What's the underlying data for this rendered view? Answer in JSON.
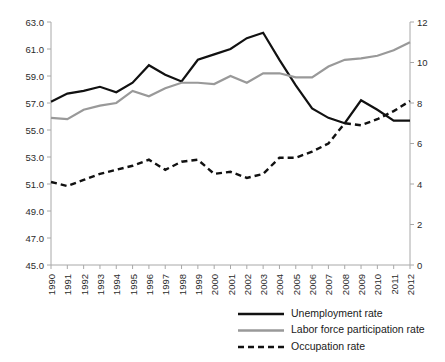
{
  "chart_data": {
    "type": "line",
    "title": "",
    "subtitle": "",
    "xlabel": "",
    "ylabel": "",
    "grid": false,
    "legend_position": "bottom-right",
    "categories": [
      "1990",
      "1991",
      "1992",
      "1993",
      "1994",
      "1995",
      "1996",
      "1997",
      "1998",
      "1999",
      "2000",
      "2001",
      "2002",
      "2003",
      "2004",
      "2005",
      "2006",
      "2007",
      "2008",
      "2009",
      "2010",
      "2011",
      "2012"
    ],
    "axes": {
      "left": {
        "label": "",
        "min": 45.0,
        "max": 63.0,
        "step": 2.0,
        "ticks": [
          "45.0",
          "47.0",
          "49.0",
          "51.0",
          "53.0",
          "55.0",
          "57.0",
          "59.0",
          "61.0",
          "63.0"
        ]
      },
      "right": {
        "label": "",
        "min": 0,
        "max": 12,
        "step": 2,
        "ticks": [
          "0",
          "2",
          "4",
          "6",
          "8",
          "10",
          "12"
        ]
      }
    },
    "series": [
      {
        "name": "Unemployment rate",
        "axis": "left",
        "style": "solid",
        "color": "#111111",
        "width": 2.2,
        "values": [
          57.1,
          57.7,
          57.9,
          58.2,
          57.8,
          58.5,
          59.8,
          59.1,
          58.6,
          60.2,
          60.6,
          61.0,
          61.8,
          62.2,
          60.2,
          58.3,
          56.6,
          55.9,
          55.5,
          57.2,
          56.5,
          55.7,
          55.7
        ]
      },
      {
        "name": "Labor force participation rate",
        "axis": "left",
        "style": "solid",
        "color": "#999999",
        "width": 2.2,
        "values": [
          55.9,
          55.8,
          56.5,
          56.8,
          57.0,
          57.9,
          57.5,
          58.1,
          58.5,
          58.5,
          58.4,
          59.0,
          58.5,
          59.2,
          59.2,
          58.9,
          58.9,
          59.7,
          60.2,
          60.3,
          60.5,
          60.9,
          61.5
        ]
      },
      {
        "name": "Occupation rate",
        "axis": "right",
        "style": "dashed",
        "color": "#111111",
        "width": 2.4,
        "values": [
          4.1,
          3.9,
          4.2,
          4.5,
          4.7,
          4.9,
          5.2,
          4.7,
          5.1,
          5.2,
          4.5,
          4.6,
          4.3,
          4.5,
          5.3,
          5.3,
          5.6,
          6.0,
          7.0,
          6.9,
          7.2,
          7.6,
          8.1
        ]
      }
    ]
  },
  "legend": {
    "items": [
      {
        "label": "Unemployment rate",
        "style": "solid",
        "color": "#111111"
      },
      {
        "label": "Labor force participation rate",
        "style": "solid",
        "color": "#999999"
      },
      {
        "label": "Occupation rate",
        "style": "dashed",
        "color": "#111111"
      }
    ]
  }
}
